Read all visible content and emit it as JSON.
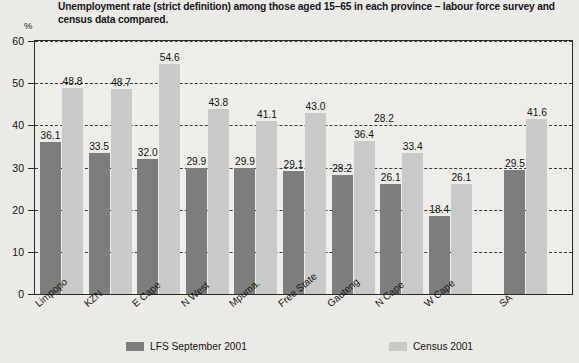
{
  "header": {
    "title": "Unemployment rate (strict definition) among those  aged 15–65 in each province – labour force survey and census data compared."
  },
  "axis": {
    "y_unit": "%",
    "y_ticks": [
      "60",
      "50",
      "40",
      "30",
      "20",
      "10",
      "0"
    ]
  },
  "legend": {
    "entries": [
      {
        "label": "LFS September 2001",
        "color": "#7d7d7d",
        "key": "lfs"
      },
      {
        "label": "Census 2001",
        "color": "#c9c9c7",
        "key": "census"
      }
    ]
  },
  "annotations": {
    "stray_value": "28.2"
  },
  "chart_data": {
    "type": "bar",
    "title": "Unemployment rate (strict definition) among those  aged 15–65 in each province – labour force survey and census data compared.",
    "xlabel": "",
    "ylabel": "%",
    "ylim": [
      0,
      60
    ],
    "ytick_step": 10,
    "grid": true,
    "grid_style": "dashed-horizontal",
    "legend_position": "bottom",
    "categories": [
      "Limpopo",
      "KZN",
      "E Cape",
      "N West",
      "Mpuma.",
      "Free State",
      "Gauteng",
      "N Cape",
      "W Cape",
      "SA"
    ],
    "series": [
      {
        "name": "LFS September 2001",
        "color": "#7d7d7d",
        "values": [
          36.1,
          33.5,
          32.0,
          29.9,
          29.9,
          29.1,
          28.2,
          26.1,
          18.4,
          29.5
        ],
        "labels": [
          "36.1",
          "33.5",
          "32.0",
          "29.9",
          "29.9",
          "29.1",
          "28.2",
          "26.1",
          "18.4",
          "29.5"
        ]
      },
      {
        "name": "Census 2001",
        "color": "#c9c9c7",
        "values": [
          48.8,
          48.7,
          54.6,
          43.8,
          41.1,
          43.0,
          36.4,
          33.4,
          26.1,
          41.6
        ],
        "labels": [
          "48.8",
          "48.7",
          "54.6",
          "43.8",
          "41.1",
          "43.0",
          "36.4",
          "33.4",
          "26.1",
          "41.6"
        ]
      }
    ]
  }
}
